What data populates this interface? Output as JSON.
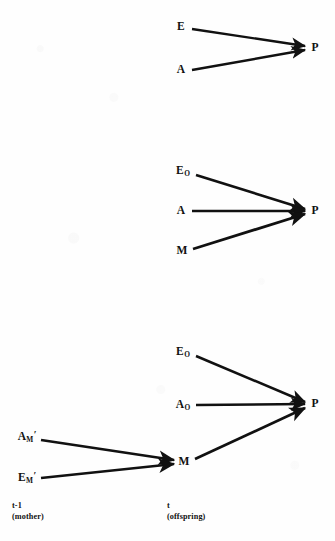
{
  "figure": {
    "type": "path-diagram",
    "background_color": "#fefefe",
    "ink_color": "#111111"
  },
  "panels": [
    {
      "id": "panel-1",
      "nodes": [
        {
          "id": "p1-E",
          "text": "E",
          "base": "E",
          "sub": "",
          "prime": false,
          "x": 181,
          "y": 27
        },
        {
          "id": "p1-A",
          "text": "A",
          "base": "A",
          "sub": "",
          "prime": false,
          "x": 181,
          "y": 70
        },
        {
          "id": "p1-P",
          "text": "P",
          "base": "P",
          "sub": "",
          "prime": false,
          "x": 315,
          "y": 48
        }
      ],
      "edges": [
        {
          "from": "p1-E",
          "to": "p1-P"
        },
        {
          "from": "p1-A",
          "to": "p1-P"
        }
      ]
    },
    {
      "id": "panel-2",
      "nodes": [
        {
          "id": "p2-EO",
          "text": "EO",
          "base": "E",
          "sub": "O",
          "prime": false,
          "x": 181,
          "y": 171
        },
        {
          "id": "p2-A",
          "text": "A",
          "base": "A",
          "sub": "",
          "prime": false,
          "x": 181,
          "y": 211
        },
        {
          "id": "p2-M",
          "text": "M",
          "base": "M",
          "sub": "",
          "prime": false,
          "x": 182,
          "y": 251
        },
        {
          "id": "p2-P",
          "text": "P",
          "base": "P",
          "sub": "",
          "prime": false,
          "x": 315,
          "y": 211
        }
      ],
      "edges": [
        {
          "from": "p2-EO",
          "to": "p2-P"
        },
        {
          "from": "p2-A",
          "to": "p2-P"
        },
        {
          "from": "p2-M",
          "to": "p2-P"
        }
      ]
    },
    {
      "id": "panel-3",
      "nodes": [
        {
          "id": "p3-EO",
          "text": "EO",
          "base": "E",
          "sub": "O",
          "prime": false,
          "x": 181,
          "y": 352
        },
        {
          "id": "p3-AO",
          "text": "AO",
          "base": "A",
          "sub": "O",
          "prime": false,
          "x": 181,
          "y": 405
        },
        {
          "id": "p3-AM",
          "text": "AM'",
          "base": "A",
          "sub": "M",
          "prime": true,
          "x": 26,
          "y": 437
        },
        {
          "id": "p3-EM",
          "text": "EM'",
          "base": "E",
          "sub": "M",
          "prime": true,
          "x": 26,
          "y": 478
        },
        {
          "id": "p3-M",
          "text": "M",
          "base": "M",
          "sub": "",
          "prime": false,
          "x": 184,
          "y": 462
        },
        {
          "id": "p3-P",
          "text": "P",
          "base": "P",
          "sub": "",
          "prime": false,
          "x": 315,
          "y": 404
        }
      ],
      "edges": [
        {
          "from": "p3-EO",
          "to": "p3-P"
        },
        {
          "from": "p3-AO",
          "to": "p3-P"
        },
        {
          "from": "p3-M",
          "to": "p3-P"
        },
        {
          "from": "p3-AM",
          "to": "p3-M"
        },
        {
          "from": "p3-EM",
          "to": "p3-M"
        }
      ]
    }
  ],
  "axis_captions": {
    "left": {
      "line1": "t-1",
      "line2": "(mother)",
      "x": 12,
      "y": 500
    },
    "right": {
      "line1": "t",
      "line2": "(offspring)",
      "x": 167,
      "y": 500
    }
  }
}
